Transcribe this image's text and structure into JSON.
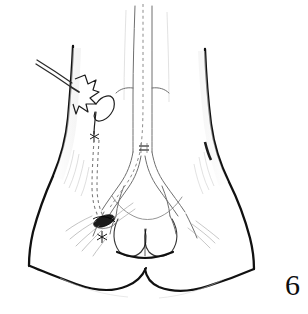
{
  "figure": {
    "number": "6",
    "caption_text": "",
    "domain": "medical-surgical-line-illustration",
    "background_color": "#ffffff",
    "ink_color": "#111111",
    "light_ink_color": "#8a8a8a",
    "mid_ink_color": "#5a5a5a",
    "width": 308,
    "height": 314
  },
  "labels": {
    "figure_number_label": "6"
  },
  "anatomy": {
    "view": "anterior lower abdomen, groin and upper thighs",
    "parts": [
      {
        "name": "left-thigh-outline",
        "shade": "#111111"
      },
      {
        "name": "right-thigh-outline",
        "shade": "#111111"
      },
      {
        "name": "perineum-outline",
        "shade": "#111111"
      },
      {
        "name": "scrotum-outline",
        "shade": "#222222"
      },
      {
        "name": "abdominal-midline-shading",
        "shade": "#9a9a9a"
      }
    ]
  },
  "vasculature": {
    "stroke": "#6f6f6f",
    "vessels": [
      {
        "name": "aorta",
        "label": ""
      },
      {
        "name": "aortic-bifurcation",
        "label": ""
      },
      {
        "name": "left-common-iliac-artery",
        "label": ""
      },
      {
        "name": "right-common-iliac-artery",
        "label": ""
      },
      {
        "name": "left-femoral-artery",
        "label": ""
      },
      {
        "name": "right-femoral-artery",
        "label": ""
      },
      {
        "name": "left-profunda-branch",
        "label": ""
      },
      {
        "name": "right-profunda-branch",
        "label": ""
      }
    ]
  },
  "instruments": {
    "items": [
      {
        "name": "tunneler-shaft",
        "label": ""
      },
      {
        "name": "skin-incision-flap",
        "label": ""
      },
      {
        "name": "suture-loop",
        "label": ""
      },
      {
        "name": "suture-knot-upper",
        "label": ""
      },
      {
        "name": "suture-knot-lower",
        "label": ""
      },
      {
        "name": "anastomosis-site",
        "label": ""
      },
      {
        "name": "vessel-clip-marker",
        "label": ""
      }
    ]
  },
  "graft": {
    "name": "subcutaneous-graft-tunnel",
    "style": "dashed",
    "stroke": "#7d7d7d",
    "dash_pattern": "3 3"
  }
}
